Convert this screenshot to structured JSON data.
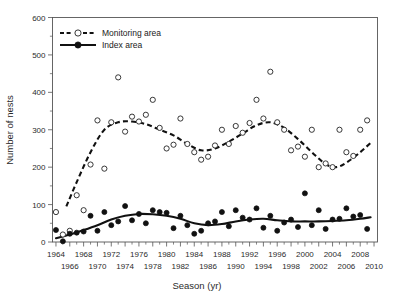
{
  "chart_data": {
    "type": "scatter",
    "title": "",
    "xlabel": "Season (yr)",
    "ylabel": "Number of nests",
    "xlim": [
      1963.5,
      2010.5
    ],
    "ylim": [
      0,
      600
    ],
    "yticks": [
      0,
      100,
      200,
      300,
      400,
      500,
      600
    ],
    "ytick_minor_step": 50,
    "xticks_upper": [
      1964,
      1968,
      1972,
      1976,
      1980,
      1984,
      1988,
      1992,
      1996,
      2000,
      2004,
      2008
    ],
    "xticks_lower": [
      1966,
      1970,
      1974,
      1978,
      1982,
      1986,
      1990,
      1994,
      1998,
      2002,
      2006,
      2010
    ],
    "grid": false,
    "legend_position": "top-left",
    "series": [
      {
        "name": "Monitoring area",
        "marker": "open-circle",
        "line": "dashed",
        "color": "#111111",
        "x": [
          1964,
          1965,
          1966,
          1967,
          1968,
          1969,
          1970,
          1971,
          1972,
          1973,
          1974,
          1975,
          1976,
          1977,
          1978,
          1979,
          1980,
          1981,
          1982,
          1983,
          1984,
          1985,
          1986,
          1987,
          1988,
          1989,
          1990,
          1991,
          1992,
          1993,
          1994,
          1995,
          1996,
          1997,
          1998,
          1999,
          2000,
          2001,
          2002,
          2003,
          2004,
          2005,
          2006,
          2007,
          2008,
          2009
        ],
        "values": [
          80,
          20,
          30,
          125,
          85,
          207,
          325,
          196,
          320,
          440,
          295,
          335,
          322,
          340,
          380,
          305,
          250,
          260,
          330,
          262,
          240,
          220,
          228,
          258,
          300,
          262,
          310,
          292,
          318,
          380,
          330,
          455,
          320,
          300,
          245,
          255,
          228,
          300,
          200,
          210,
          200,
          300,
          240,
          230,
          300,
          325
        ],
        "note": "Open circles; dashed fitted trend rises to ~320 by 1972, dips ~240 near 1985, peaks ~320 near 1995, minimum ~200 near 2004, rising to ~265 by 2009"
      },
      {
        "name": "Index area",
        "marker": "filled-circle",
        "line": "solid",
        "color": "#111111",
        "x": [
          1964,
          1965,
          1966,
          1967,
          1968,
          1969,
          1970,
          1971,
          1972,
          1973,
          1974,
          1975,
          1976,
          1977,
          1978,
          1979,
          1980,
          1981,
          1982,
          1983,
          1984,
          1985,
          1986,
          1987,
          1988,
          1989,
          1990,
          1991,
          1992,
          1993,
          1994,
          1995,
          1996,
          1997,
          1998,
          1999,
          2000,
          2001,
          2002,
          2003,
          2004,
          2005,
          2006,
          2007,
          2008,
          2009
        ],
        "values": [
          32,
          2,
          22,
          25,
          28,
          70,
          30,
          80,
          45,
          55,
          96,
          58,
          75,
          50,
          85,
          80,
          78,
          37,
          70,
          45,
          22,
          30,
          50,
          55,
          80,
          42,
          85,
          65,
          60,
          90,
          38,
          70,
          30,
          52,
          60,
          40,
          130,
          45,
          85,
          35,
          60,
          62,
          90,
          68,
          72,
          35
        ],
        "note": "Filled circles; solid fitted trend rises from ~10 in 1964 to ~75 by 1976, dips to ~45 near 1985, rises to ~62 by 1993, flat ~55-65 thereafter"
      }
    ],
    "trend_monitoring": {
      "x": [
        1965.5,
        1967,
        1969,
        1971,
        1973,
        1975,
        1977,
        1979,
        1981,
        1983,
        1985,
        1987,
        1989,
        1991,
        1993,
        1995,
        1997,
        1999,
        2001,
        2003,
        2004.5,
        2006,
        2008,
        2009.5
      ],
      "y": [
        95,
        160,
        240,
        300,
        320,
        322,
        315,
        300,
        285,
        262,
        245,
        250,
        268,
        290,
        312,
        320,
        305,
        275,
        240,
        208,
        200,
        212,
        240,
        265
      ]
    },
    "trend_index": {
      "x": [
        1964,
        1966,
        1968,
        1970,
        1972,
        1974,
        1976,
        1978,
        1980,
        1982,
        1984,
        1986,
        1988,
        1990,
        1992,
        1994,
        1996,
        1998,
        2000,
        2002,
        2004,
        2006,
        2008,
        2009.5
      ],
      "y": [
        10,
        20,
        32,
        45,
        60,
        70,
        75,
        74,
        70,
        62,
        50,
        45,
        48,
        55,
        60,
        62,
        58,
        55,
        55,
        55,
        56,
        58,
        62,
        66
      ]
    }
  },
  "legend": {
    "items": [
      {
        "label": "Monitoring area",
        "style": "dashed-open-circle"
      },
      {
        "label": "Index area",
        "style": "solid-filled-circle"
      }
    ]
  },
  "axes": {
    "y_title": "Number of nests",
    "x_title": "Season (yr)"
  }
}
